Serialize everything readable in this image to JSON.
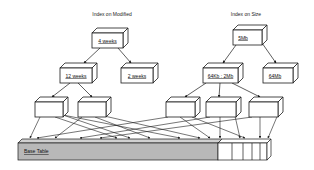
{
  "diagram": {
    "colors": {
      "stroke": "#1a1a1a",
      "box_fill": "#ffffff",
      "base_table_fill": "#b8b8b8",
      "base_table_top": "#d0d0d0",
      "background": "#ffffff"
    },
    "index_modified": {
      "title": "Index on Modified",
      "root": {
        "label": "4 weeks"
      },
      "children": [
        {
          "label": "12 weeks"
        },
        {
          "label": "2 weeks"
        }
      ]
    },
    "index_size": {
      "title": "Index on Size",
      "root": {
        "label": "5Mb"
      },
      "children": [
        {
          "label": "64Kb : 2Mb"
        },
        {
          "label": "64Mb"
        }
      ]
    },
    "leaf_pages": [
      {
        "label": ""
      },
      {
        "label": ""
      },
      {
        "label": ""
      },
      {
        "label": ""
      },
      {
        "label": ""
      }
    ],
    "base_table": {
      "label": "Base Table",
      "segments": 5
    }
  }
}
